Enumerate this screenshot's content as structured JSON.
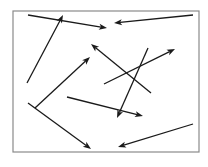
{
  "diagram": {
    "type": "random-arrows",
    "background": "#ffffff",
    "frame": {
      "x": 13,
      "y": 11,
      "width": 186,
      "height": 141,
      "stroke": "#8a8a8a",
      "stroke_width": 1.2
    },
    "arrow_color": "#1a1a1a",
    "arrow_width": 1.3,
    "arrows": [
      {
        "id": "arrow-1",
        "x1": 28,
        "y1": 15,
        "x2": 107,
        "y2": 28
      },
      {
        "id": "arrow-2",
        "x1": 27,
        "y1": 83,
        "x2": 63,
        "y2": 15
      },
      {
        "id": "arrow-3",
        "x1": 193,
        "y1": 15,
        "x2": 114,
        "y2": 23
      },
      {
        "id": "arrow-4",
        "x1": 151,
        "y1": 93,
        "x2": 91,
        "y2": 44
      },
      {
        "id": "arrow-5",
        "x1": 104,
        "y1": 84,
        "x2": 175,
        "y2": 49
      },
      {
        "id": "arrow-6",
        "x1": 148,
        "y1": 48,
        "x2": 117,
        "y2": 118
      },
      {
        "id": "arrow-7",
        "x1": 35,
        "y1": 108,
        "x2": 90,
        "y2": 57
      },
      {
        "id": "arrow-8",
        "x1": 28,
        "y1": 103,
        "x2": 91,
        "y2": 149
      },
      {
        "id": "arrow-9",
        "x1": 67,
        "y1": 97,
        "x2": 143,
        "y2": 116
      },
      {
        "id": "arrow-10",
        "x1": 193,
        "y1": 124,
        "x2": 118,
        "y2": 147
      }
    ]
  }
}
